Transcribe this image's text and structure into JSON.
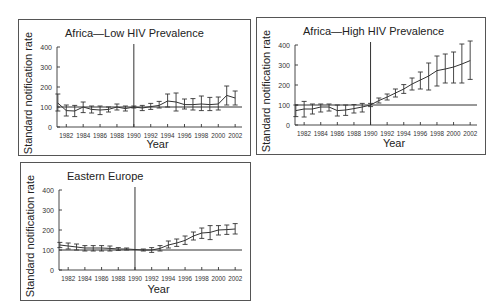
{
  "chart_data": [
    {
      "type": "line",
      "title": "Africa—Low HIV Prevalence",
      "xlabel": "Year",
      "ylabel": "Standard notification rate",
      "ylim": [
        0,
        400
      ],
      "yticks": [
        0,
        100,
        200,
        300,
        400
      ],
      "xtick_labels": [
        "1982",
        "1984",
        "1986",
        "1988",
        "1990",
        "1992",
        "1994",
        "1996",
        "1998",
        "2000",
        "2002"
      ],
      "reference_line": 100,
      "divider_year": 1990,
      "grid": false,
      "series": [
        {
          "name": "Standard notification rate",
          "x": [
            1981,
            1982,
            1983,
            1984,
            1985,
            1986,
            1987,
            1988,
            1989,
            1990,
            1991,
            1992,
            1993,
            1994,
            1995,
            1996,
            1997,
            1998,
            1999,
            2000,
            2001,
            2002
          ],
          "values": [
            120,
            82,
            80,
            100,
            88,
            85,
            88,
            100,
            92,
            100,
            95,
            102,
            108,
            130,
            125,
            112,
            112,
            115,
            112,
            115,
            158,
            145
          ],
          "lower": [
            80,
            55,
            52,
            72,
            70,
            62,
            75,
            85,
            80,
            95,
            82,
            88,
            95,
            100,
            80,
            90,
            85,
            82,
            82,
            85,
            110,
            110
          ],
          "upper": [
            165,
            110,
            108,
            125,
            105,
            105,
            100,
            115,
            105,
            105,
            108,
            118,
            128,
            165,
            170,
            140,
            142,
            155,
            148,
            150,
            205,
            180
          ]
        }
      ]
    },
    {
      "type": "line",
      "title": "Africa—High HIV Prevalence",
      "xlabel": "Year",
      "ylabel": "Standard notification rate",
      "ylim": [
        0,
        400
      ],
      "yticks": [
        0,
        100,
        200,
        300,
        400
      ],
      "xtick_labels": [
        "1982",
        "1984",
        "1986",
        "1988",
        "1990",
        "1992",
        "1994",
        "1996",
        "1998",
        "2000",
        "2002"
      ],
      "reference_line": 100,
      "divider_year": 1990,
      "grid": false,
      "series": [
        {
          "name": "Standard notification rate",
          "x": [
            1981,
            1982,
            1983,
            1984,
            1985,
            1986,
            1987,
            1988,
            1989,
            1990,
            1991,
            1992,
            1993,
            1994,
            1995,
            1996,
            1997,
            1998,
            1999,
            2000,
            2001,
            2002
          ],
          "values": [
            72,
            80,
            80,
            90,
            90,
            72,
            75,
            82,
            90,
            100,
            122,
            140,
            160,
            180,
            205,
            225,
            245,
            272,
            280,
            290,
            305,
            322
          ],
          "lower": [
            42,
            40,
            55,
            65,
            70,
            45,
            48,
            60,
            65,
            92,
            110,
            125,
            140,
            158,
            175,
            180,
            175,
            195,
            210,
            210,
            210,
            228
          ],
          "upper": [
            100,
            118,
            105,
            105,
            105,
            100,
            100,
            102,
            108,
            108,
            135,
            155,
            180,
            202,
            235,
            265,
            310,
            345,
            355,
            365,
            405,
            420
          ]
        }
      ]
    },
    {
      "type": "line",
      "title": "Eastern Europe",
      "xlabel": "Year",
      "ylabel": "Standard notification rate",
      "ylim": [
        0,
        400
      ],
      "yticks": [
        0,
        100,
        200,
        300,
        400
      ],
      "xtick_labels": [
        "1982",
        "1984",
        "1986",
        "1988",
        "1990",
        "1992",
        "1994",
        "1996",
        "1998",
        "2000",
        "2002"
      ],
      "reference_line": 100,
      "divider_year": 1990,
      "grid": false,
      "series": [
        {
          "name": "Standard notification rate",
          "x": [
            1981,
            1982,
            1983,
            1984,
            1985,
            1986,
            1987,
            1988,
            1989,
            1991,
            1992,
            1993,
            1994,
            1995,
            1996,
            1997,
            1998,
            1999,
            2000,
            2001,
            2002
          ],
          "values": [
            125,
            120,
            115,
            110,
            110,
            110,
            108,
            105,
            105,
            100,
            100,
            108,
            125,
            135,
            148,
            170,
            185,
            188,
            200,
            202,
            205
          ],
          "lower": [
            112,
            105,
            100,
            95,
            95,
            95,
            95,
            98,
            100,
            95,
            88,
            95,
            110,
            118,
            128,
            150,
            158,
            152,
            175,
            178,
            180
          ],
          "upper": [
            138,
            135,
            130,
            122,
            122,
            122,
            120,
            112,
            110,
            105,
            112,
            122,
            145,
            155,
            170,
            190,
            210,
            222,
            222,
            225,
            232
          ]
        }
      ]
    }
  ]
}
